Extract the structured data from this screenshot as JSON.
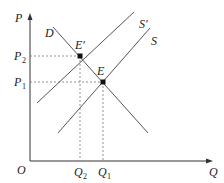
{
  "diagram": {
    "type": "supply-demand",
    "axes": {
      "y_label": "P",
      "x_label": "Q",
      "origin_label": "O"
    },
    "curves": [
      {
        "name": "D",
        "label": "D",
        "kind": "demand"
      },
      {
        "name": "S'",
        "label": "S′",
        "kind": "supply-shifted"
      },
      {
        "name": "S",
        "label": "S",
        "kind": "supply"
      }
    ],
    "equilibria": [
      {
        "label": "E′",
        "price": "P2",
        "quantity": "Q2"
      },
      {
        "label": "E",
        "price": "P1",
        "quantity": "Q1"
      }
    ],
    "ticks": {
      "p2": {
        "base": "P",
        "sub": "2"
      },
      "p1": {
        "base": "P",
        "sub": "1"
      },
      "q2": {
        "base": "Q",
        "sub": "2"
      },
      "q1": {
        "base": "Q",
        "sub": "1"
      }
    },
    "colors": {
      "axis": "#333333",
      "curve": "#555555",
      "guide": "#777777",
      "point": "#111111"
    }
  }
}
